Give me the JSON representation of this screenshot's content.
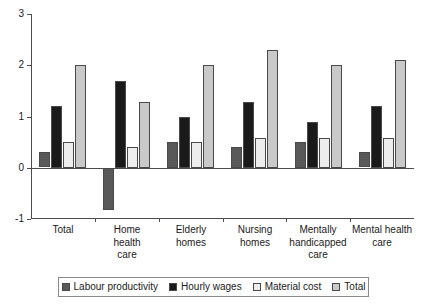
{
  "chart_data": {
    "type": "bar",
    "title": "",
    "subtitle": "",
    "xlabel": "",
    "ylabel": "",
    "ylim": [
      -1,
      3
    ],
    "yticks": [
      -1,
      0,
      1,
      2,
      3
    ],
    "ytick_labels": [
      "-1",
      "0",
      "1",
      "2",
      "3"
    ],
    "grid": false,
    "legend_position": "bottom",
    "categories": [
      "Total",
      "Home health care",
      "Elderly homes",
      "Nursing homes",
      "Mentally handicapped care",
      "Mental health care"
    ],
    "category_lines": [
      [
        "Total"
      ],
      [
        "Home",
        "health",
        "care"
      ],
      [
        "Elderly",
        "homes"
      ],
      [
        "Nursing",
        "homes"
      ],
      [
        "Mentally",
        "handicapped",
        "care"
      ],
      [
        "Mental health",
        "care"
      ]
    ],
    "series": [
      {
        "name": "Labour productivity",
        "color": "#595959",
        "values": [
          0.3,
          -0.82,
          0.5,
          0.4,
          0.5,
          0.3
        ]
      },
      {
        "name": "Hourly wages",
        "color": "#1a1a1a",
        "values": [
          1.2,
          1.7,
          1.0,
          1.28,
          0.9,
          1.2
        ]
      },
      {
        "name": "Material cost",
        "color": "#ededed",
        "values": [
          0.5,
          0.4,
          0.5,
          0.58,
          0.58,
          0.58
        ]
      },
      {
        "name": "Total",
        "color": "#c9c9c9",
        "values": [
          2.0,
          1.28,
          2.0,
          2.3,
          2.0,
          2.1
        ]
      }
    ]
  },
  "legend": {
    "items": [
      {
        "label": "Labour productivity",
        "color": "#595959"
      },
      {
        "label": "Hourly wages",
        "color": "#1a1a1a"
      },
      {
        "label": "Material cost",
        "color": "#ededed"
      },
      {
        "label": "Total",
        "color": "#c9c9c9"
      }
    ]
  }
}
